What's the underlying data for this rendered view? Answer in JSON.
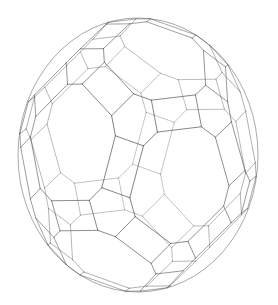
{
  "figure": {
    "kind": "wireframe-polyhedron",
    "object_name": "truncated icosidodecahedron",
    "caption": "",
    "background_color": "#ffffff",
    "line_color": "#4a4a4a",
    "silhouette_color": "#3a3a3a",
    "line_width": 0.62,
    "silhouette_line_width": 0.8,
    "canvas": {
      "width": 278,
      "height": 305
    },
    "projection": {
      "type": "orthographic",
      "center_x": 138,
      "center_y": 155,
      "radius_x": 120,
      "radius_y": 137,
      "rotation_x_deg": -16,
      "rotation_y_deg": 22,
      "rotation_z_deg": 6
    },
    "bounds": {
      "left": 18,
      "right": 258,
      "top": 18,
      "bottom": 292
    },
    "geometry": {
      "face_counts": {
        "decagon": 12,
        "hexagon": 20,
        "square": 30
      },
      "vertex_count": 120,
      "edge_count": 180,
      "truncation": 0.38,
      "square_inset": 0.34
    }
  }
}
